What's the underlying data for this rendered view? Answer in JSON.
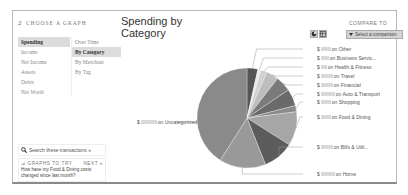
{
  "step": {
    "number": "2",
    "title": "Choose a Graph"
  },
  "nav": {
    "primary": [
      {
        "label": "Spending",
        "active": true
      },
      {
        "label": "Income",
        "active": false
      },
      {
        "label": "Net Income",
        "active": false
      },
      {
        "label": "Assets",
        "active": false
      },
      {
        "label": "Debts",
        "active": false
      },
      {
        "label": "Net Worth",
        "active": false
      }
    ],
    "secondary": [
      {
        "label": "Over Time",
        "active": false
      },
      {
        "label": "By Category",
        "active": true
      },
      {
        "label": "By Merchant",
        "active": false
      },
      {
        "label": "By Tag",
        "active": false
      }
    ]
  },
  "search": {
    "label": "Search these transactions »",
    "icon": "search-icon"
  },
  "tips": {
    "header": "Graphs to try",
    "next_label": "Next »",
    "question": "How have my Food & Dining costs changed since last month?"
  },
  "chart_header": {
    "title": "Spending by Category",
    "icons": [
      "pie-chart-icon",
      "table-icon"
    ]
  },
  "compare": {
    "label": "Compare to",
    "select_value": "Select a comparison"
  },
  "chart_data": {
    "type": "pie",
    "title": "Spending by Category",
    "categories": [
      "Other",
      "Business Servic...",
      "Health & Fitness",
      "Travel",
      "Financial",
      "Auto & Transport",
      "Shopping",
      "Food & Dining",
      "Bills & Utili...",
      "Home",
      "Uncategorized"
    ],
    "values": [
      3.5,
      1.0,
      2.0,
      4.0,
      5.0,
      5.5,
      2.0,
      11.0,
      10.0,
      15.0,
      41.0
    ],
    "colors": [
      "#555555",
      "#e8e8e8",
      "#d0d0d0",
      "#bdbdbd",
      "#7a7a7a",
      "#6a6a6a",
      "#8c8c8c",
      "#a6a6a6",
      "#5c5c5c",
      "#999999",
      "#8a8a8a"
    ],
    "label_prefix": "$",
    "label_amounts_redacted": true,
    "label_texts": [
      "on Other",
      "on Business Servic...",
      "on Health & Fitness",
      "on Travel",
      "on Financial",
      "on Auto & Transport",
      "on Shopping",
      "on Food & Dining",
      "on Bills & Utili...",
      "on Home",
      "on Uncategorized"
    ]
  }
}
